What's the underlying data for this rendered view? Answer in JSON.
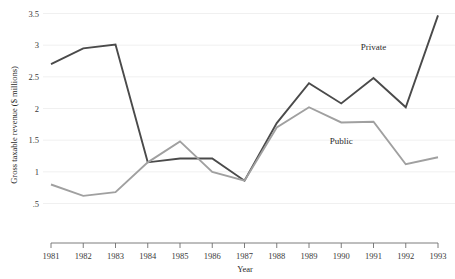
{
  "chart_data": {
    "type": "line",
    "title": "",
    "xlabel": "Year",
    "ylabel": "Gross taxable revenue ($ millions)",
    "x": [
      1981,
      1982,
      1983,
      1984,
      1985,
      1986,
      1987,
      1988,
      1989,
      1990,
      1991,
      1992,
      1993
    ],
    "categories": [
      "1981",
      "1982",
      "1983",
      "1984",
      "1985",
      "1986",
      "1987",
      "1988",
      "1989",
      "1990",
      "1991",
      "1992",
      "1993"
    ],
    "xlim": [
      1981,
      1993
    ],
    "ylim": [
      0.5,
      3.5
    ],
    "yticks": [
      0.5,
      1,
      1.5,
      2,
      2.5,
      3,
      3.5
    ],
    "ytick_labels": [
      ".5",
      "1",
      "1.5",
      "2",
      "2.5",
      "3",
      "3.5"
    ],
    "grid": "horizontal",
    "legend_position": "inline-annotation",
    "series": [
      {
        "name": "Private",
        "color": "#4a4a4a",
        "width": 1.9,
        "values": [
          2.7,
          2.95,
          3.01,
          1.15,
          1.21,
          1.21,
          0.86,
          1.77,
          2.4,
          2.08,
          2.48,
          2.02,
          3.47
        ],
        "label": "Private",
        "label_x": 1991,
        "label_y": 2.92
      },
      {
        "name": "Public",
        "color": "#a0a0a0",
        "width": 1.9,
        "values": [
          0.8,
          0.62,
          0.68,
          1.15,
          1.48,
          1.0,
          0.86,
          1.7,
          2.02,
          1.78,
          1.79,
          1.12,
          1.23
        ],
        "label": "Public",
        "label_x": 1990,
        "label_y": 1.44
      }
    ]
  },
  "axes": {
    "x_title": "Year",
    "y_title": "Gross taxable revenue ($ millions)"
  }
}
